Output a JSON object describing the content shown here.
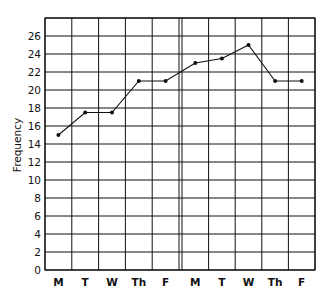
{
  "chart_data": {
    "type": "line",
    "title": "",
    "xlabel": "",
    "ylabel": "Frequency",
    "ylim": [
      0,
      28
    ],
    "yticks": [
      0,
      2,
      4,
      6,
      8,
      10,
      12,
      14,
      16,
      18,
      20,
      22,
      24,
      26
    ],
    "grid": true,
    "legend": null,
    "categories": [
      "M",
      "T",
      "W",
      "Th",
      "F",
      "M",
      "T",
      "W",
      "Th",
      "F"
    ],
    "panels": [
      {
        "name": "week-1",
        "categories": [
          "M",
          "T",
          "W",
          "Th",
          "F"
        ],
        "values": [
          15,
          17.5,
          17.5,
          21,
          21
        ]
      },
      {
        "name": "week-2",
        "categories": [
          "M",
          "T",
          "W",
          "Th",
          "F"
        ],
        "values": [
          23,
          23.5,
          25,
          21,
          21
        ]
      }
    ],
    "values": [
      15,
      17.5,
      17.5,
      21,
      21,
      23,
      23.5,
      25,
      21,
      21
    ],
    "annotations": [
      "double vertical divider separates the two weeks"
    ]
  },
  "colors": {
    "line": "#111111",
    "grid": "#111111",
    "background": "#ffffff"
  }
}
